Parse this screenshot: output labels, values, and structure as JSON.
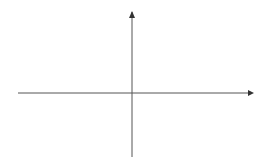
{
  "chart_data": {
    "type": "line",
    "title": "",
    "xlabel": "x",
    "ylabel": "y",
    "origin_label": "0",
    "x_tick_labels": [
      {
        "value": 1,
        "label": "1"
      }
    ],
    "y_tick_labels": [
      {
        "value": 1,
        "label": "1"
      }
    ],
    "grid": true,
    "grid_step": 0.5,
    "xlim": [
      -3.5,
      3.5
    ],
    "ylim": [
      -2.0,
      2.5
    ],
    "series": [
      {
        "name": "g",
        "x": [
          -3.03,
          -2.5,
          -2.0,
          -1.75,
          -1.5,
          -1.0,
          -0.5,
          0.0,
          0.5,
          1.0,
          1.5,
          2.0,
          2.28,
          2.5,
          2.75,
          3.0
        ],
        "y": [
          2.0,
          1.55,
          1.0,
          0.37,
          0.0,
          -0.45,
          -1.0,
          -1.47,
          -1.78,
          -1.47,
          -1.03,
          -0.5,
          0.0,
          0.5,
          1.35,
          2.5
        ]
      }
    ],
    "annotations": [
      {
        "text": "g",
        "x": 2.6,
        "y": 1.9
      }
    ]
  },
  "colors": {
    "grid": "#b8b8b8",
    "axis": "#555555",
    "curve": "#666666"
  }
}
